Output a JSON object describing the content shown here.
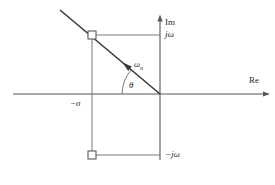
{
  "figure": {
    "axes": {
      "imaginary_label": "Im",
      "real_label": "Re",
      "origin": {
        "x": 160,
        "y": 94
      },
      "real_axis_from_x": 13,
      "real_axis_to_x": 270,
      "imag_axis_from_y": 15,
      "imag_axis_to_y": 160
    },
    "labels": {
      "jomega_positive": "jω",
      "jomega_negative": "−jω",
      "sigma_negative": "−σ",
      "omega_n": "ω",
      "omega_n_subscript": "n",
      "theta": "θ"
    },
    "markers": [
      {
        "name": "upper-pole",
        "shape": "open-square",
        "x": 92,
        "y": 35,
        "size": 8
      },
      {
        "name": "lower-pole",
        "shape": "open-square",
        "x": 92,
        "y": 155,
        "size": 8
      }
    ],
    "construction_lines": [
      {
        "name": "radial-vector-omega-n",
        "from_x": 60,
        "from_y": 10,
        "to_x": 160,
        "to_y": 94
      },
      {
        "name": "upper-projection-horizontal",
        "from_x": 92,
        "from_y": 35,
        "to_x": 160,
        "to_y": 35
      },
      {
        "name": "lower-projection-horizontal",
        "from_x": 92,
        "from_y": 155,
        "to_x": 160,
        "to_y": 155
      },
      {
        "name": "sigma-projection-vertical",
        "from_x": 92,
        "from_y": 35,
        "to_x": 92,
        "to_y": 155
      }
    ],
    "angle_arc": {
      "name": "theta-arc",
      "center_x": 160,
      "center_y": 94,
      "radius": 38
    },
    "colors": {
      "line": "#565656",
      "heavy_line": "#3a3a3a",
      "text": "#2b2b2b",
      "background": "#ffffff"
    }
  }
}
